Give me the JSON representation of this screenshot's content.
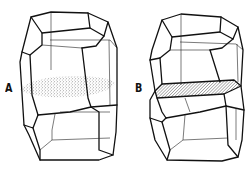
{
  "figure": {
    "panels": [
      {
        "label": "A",
        "description": "polyhedral grain with stippled (dotted) elliptical cross-section region across its middle"
      },
      {
        "label": "B",
        "description": "polyhedral grain with hatched planar hexagonal face cutting across its middle"
      }
    ],
    "colors": {
      "line": "#111111",
      "background": "#ffffff",
      "stipple": "#333333",
      "hatch": "#333333"
    }
  }
}
